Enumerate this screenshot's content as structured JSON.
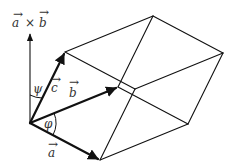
{
  "diagram": {
    "labels": {
      "cross": {
        "a": "a",
        "times": "×",
        "b": "b",
        "arrow": "→"
      },
      "vec_a": "a",
      "vec_b": "b",
      "vec_c": "c",
      "angle_phi": "φ",
      "angle_psi": "ψ",
      "arrow_mark": "→"
    },
    "vertices": {
      "origin": [
        30,
        123
      ],
      "a": [
        100,
        160
      ],
      "b": [
        118,
        87
      ],
      "c": [
        65,
        52
      ],
      "a_plus_b": [
        188,
        124
      ],
      "b_plus_c": [
        153,
        16
      ],
      "a_plus_c": [
        135,
        89
      ],
      "a_plus_b_plus_c": [
        223,
        53
      ],
      "cross_tip": [
        30,
        33
      ]
    },
    "colors": {
      "stroke": "#111111",
      "text": "#333333",
      "background": "#ffffff"
    }
  }
}
